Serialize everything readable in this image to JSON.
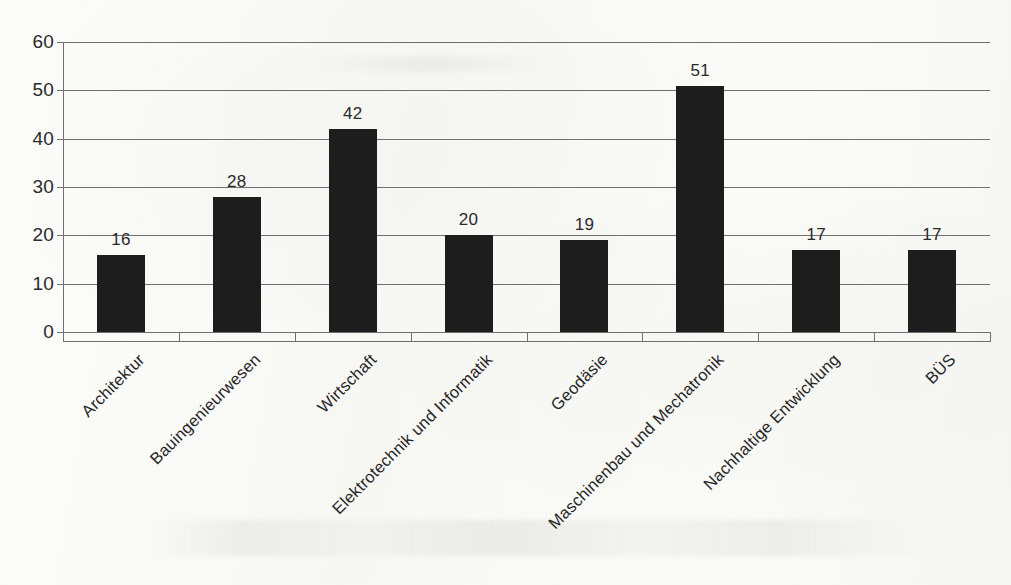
{
  "chart_data": {
    "type": "bar",
    "title": "",
    "subtitle": "",
    "xlabel": "",
    "ylabel": "",
    "categories": [
      "Architektur",
      "Bauingenieurwesen",
      "Wirtschaft",
      "Elektrotechnik  und Informatik",
      "Geodäsie",
      "Maschinenbau und Mechatronik",
      "Nachhaltige Entwicklung",
      "BÜS"
    ],
    "values": [
      16,
      28,
      42,
      20,
      19,
      51,
      17,
      17
    ],
    "data_labels": [
      "16",
      "28",
      "42",
      "20",
      "19",
      "51",
      "17",
      "17"
    ],
    "ylim": [
      0,
      60
    ],
    "y_ticks": [
      0,
      10,
      20,
      30,
      40,
      50,
      60
    ],
    "y_tick_labels": [
      "0",
      "10",
      "20",
      "30",
      "40",
      "50",
      "60"
    ],
    "grid": "horizontal",
    "legend": "none",
    "bar_color": "#1d1d1d",
    "axis_color": "#6f6f6f",
    "background_color": "#fbfbf9",
    "label_rotation_deg": -45
  }
}
